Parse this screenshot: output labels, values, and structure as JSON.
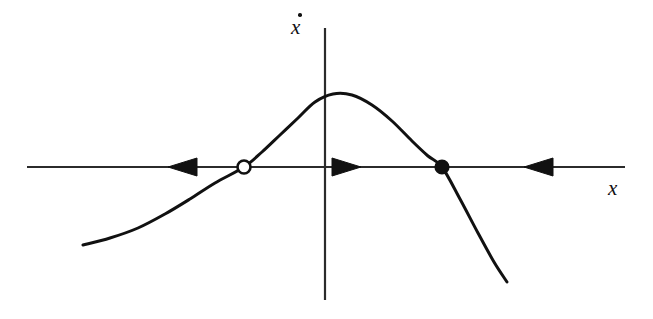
{
  "figure": {
    "kind": "phase-line-diagram",
    "title": "",
    "background_color": "#ffffff",
    "ink_color": "#111111",
    "width": 653,
    "height": 319
  },
  "axes": {
    "x_axis": {
      "label": "x",
      "label_style": "italic",
      "y_pixel": 167,
      "x_start": 27,
      "x_end": 625,
      "arrowheads": false
    },
    "y_axis": {
      "label": "x",
      "label_accent": "dot",
      "label_text_full": "ẋ",
      "label_style": "italic",
      "x_pixel": 325,
      "y_start": 28,
      "y_end": 300,
      "arrowheads": false
    }
  },
  "fixed_points": [
    {
      "name": "unstable-fixed-point",
      "marker": "open-circle",
      "fill": "#ffffff",
      "stroke": "#111111",
      "x": 244,
      "y": 167,
      "radius": 6.5,
      "stability": "unstable"
    },
    {
      "name": "stable-fixed-point",
      "marker": "filled-circle",
      "fill": "#111111",
      "stroke": "#111111",
      "x": 442,
      "y": 167,
      "radius": 6.5,
      "stability": "stable"
    }
  ],
  "flow_arrows": [
    {
      "name": "flow-arrow-left",
      "direction": "left",
      "tip_x": 168,
      "tail_x": 197,
      "y": 167,
      "half_height": 9
    },
    {
      "name": "flow-arrow-middle",
      "direction": "right",
      "tip_x": 361,
      "tail_x": 332,
      "y": 167,
      "half_height": 9
    },
    {
      "name": "flow-arrow-right",
      "direction": "left",
      "tip_x": 524,
      "tail_x": 553,
      "y": 167,
      "half_height": 9
    }
  ],
  "chart_data": {
    "type": "line",
    "title": "",
    "xlabel": "x",
    "ylabel": "x-dot",
    "grid": false,
    "legend": null,
    "axis_origin_pixel": [
      325,
      167
    ],
    "curve": {
      "name": "xdot-of-x",
      "stroke": "#111111",
      "stroke_width": 3,
      "points_pixel": [
        [
          83,
          245
        ],
        [
          110,
          238
        ],
        [
          138,
          228
        ],
        [
          165,
          214
        ],
        [
          190,
          199
        ],
        [
          215,
          183
        ],
        [
          244,
          167
        ],
        [
          262,
          152
        ],
        [
          280,
          135
        ],
        [
          298,
          118
        ],
        [
          315,
          102
        ],
        [
          333,
          94
        ],
        [
          352,
          95
        ],
        [
          372,
          105
        ],
        [
          392,
          121
        ],
        [
          412,
          141
        ],
        [
          428,
          156
        ],
        [
          442,
          167
        ],
        [
          460,
          199
        ],
        [
          478,
          233
        ],
        [
          494,
          262
        ],
        [
          507,
          282
        ]
      ],
      "zero_crossings_pixel": [
        244,
        442
      ],
      "maximum_pixel": [
        333,
        94
      ],
      "endpoints_pixel": [
        [
          83,
          245
        ],
        [
          507,
          282
        ]
      ]
    }
  }
}
